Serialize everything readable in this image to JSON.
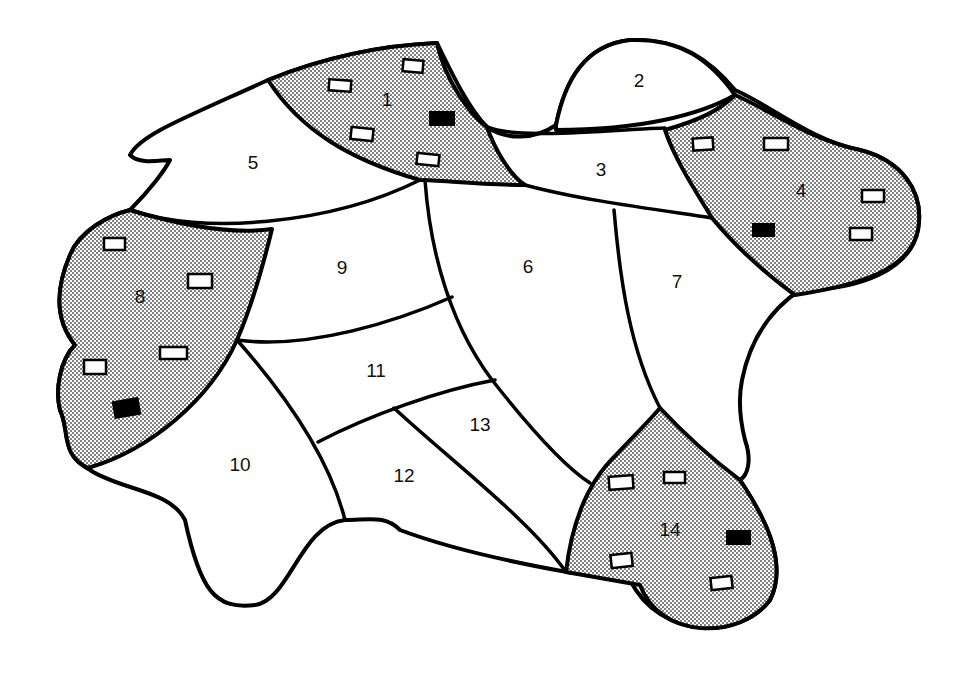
{
  "diagram": {
    "type": "map of numbered regions",
    "colors": {
      "stroke": "#000000",
      "shaded_fill": "#d9d9d9",
      "plain_fill": "#ffffff",
      "dark_house": "#000000"
    },
    "regions": [
      {
        "id": "1",
        "label": "1",
        "shaded": true,
        "x": 387,
        "y": 101
      },
      {
        "id": "2",
        "label": "2",
        "shaded": false,
        "x": 639,
        "y": 82
      },
      {
        "id": "3",
        "label": "3",
        "shaded": false,
        "x": 601,
        "y": 171
      },
      {
        "id": "4",
        "label": "4",
        "shaded": true,
        "x": 801,
        "y": 192
      },
      {
        "id": "5",
        "label": "5",
        "shaded": false,
        "x": 253,
        "y": 164
      },
      {
        "id": "6",
        "label": "6",
        "shaded": false,
        "x": 528,
        "y": 268
      },
      {
        "id": "7",
        "label": "7",
        "shaded": false,
        "x": 677,
        "y": 283
      },
      {
        "id": "8",
        "label": "8",
        "shaded": true,
        "x": 140,
        "y": 298
      },
      {
        "id": "9",
        "label": "9",
        "shaded": false,
        "x": 342,
        "y": 269
      },
      {
        "id": "10",
        "label": "10",
        "shaded": false,
        "x": 240,
        "y": 466
      },
      {
        "id": "11",
        "label": "11",
        "shaded": false,
        "x": 376,
        "y": 372
      },
      {
        "id": "12",
        "label": "12",
        "shaded": false,
        "x": 404,
        "y": 477
      },
      {
        "id": "13",
        "label": "13",
        "shaded": false,
        "x": 480,
        "y": 426
      },
      {
        "id": "14",
        "label": "14",
        "shaded": true,
        "x": 670,
        "y": 531
      }
    ],
    "houses": {
      "region_1": {
        "white": 4,
        "black": 1
      },
      "region_4": {
        "white": 4,
        "black": 1
      },
      "region_8": {
        "white": 4,
        "black": 1
      },
      "region_14": {
        "white": 4,
        "black": 1
      }
    }
  }
}
